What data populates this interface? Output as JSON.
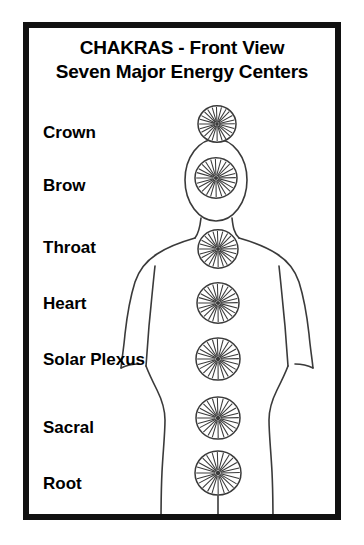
{
  "poster": {
    "title_line_1": "CHAKRAS - Front View",
    "title_line_2": "Seven Major Energy Centers",
    "border_color": "#111111",
    "background_color": "#ffffff",
    "ink_color": "#3a3a3a",
    "text_color": "#000000"
  },
  "chart_data": {
    "type": "diagram",
    "title": "CHAKRAS - Front View",
    "subtitle": "Seven Major Energy Centers",
    "diagram_subject": "human-body-front-view",
    "symbol_type": "spoked-wheel",
    "spokes_per_symbol": 24,
    "count": 7,
    "labels": [
      "Crown",
      "Brow",
      "Throat",
      "Heart",
      "Solar Plexus",
      "Sacral",
      "Root"
    ],
    "points": [
      {
        "label": "Crown",
        "cx": 188,
        "cy": 96,
        "r": 19,
        "label_y": 105
      },
      {
        "label": "Brow",
        "cx": 187,
        "cy": 150,
        "r": 21,
        "label_y": 158
      },
      {
        "label": "Throat",
        "cx": 189,
        "cy": 221,
        "r": 20,
        "label_y": 220
      },
      {
        "label": "Heart",
        "cx": 189,
        "cy": 275,
        "r": 21,
        "label_y": 276
      },
      {
        "label": "Solar Plexus",
        "cx": 189,
        "cy": 331,
        "r": 22,
        "label_y": 332
      },
      {
        "label": "Sacral",
        "cx": 189,
        "cy": 390,
        "r": 22,
        "label_y": 400
      },
      {
        "label": "Root",
        "cx": 189,
        "cy": 445,
        "r": 23,
        "label_y": 456
      }
    ],
    "xlabel": "",
    "ylabel": "",
    "legend": []
  }
}
